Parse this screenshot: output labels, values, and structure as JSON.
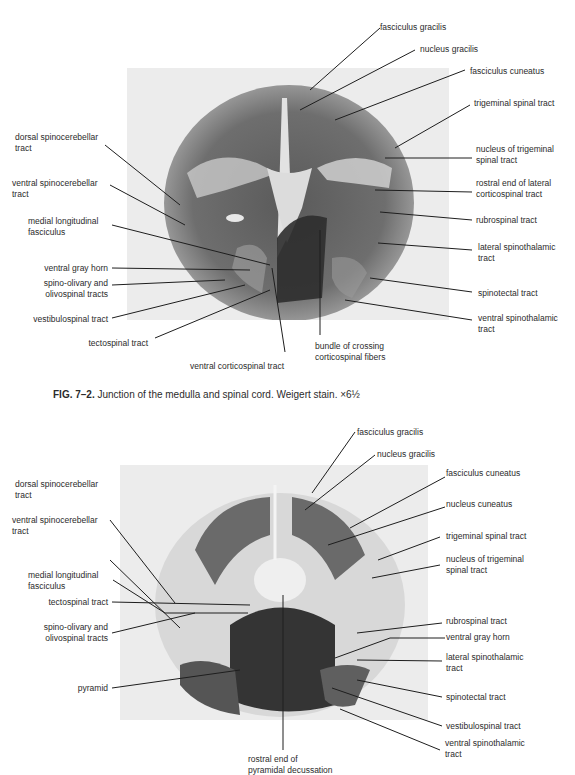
{
  "figure1": {
    "caption": {
      "number": "FIG. 7–2.",
      "text": "Junction of the medulla and spinal cord. Weigert stain. ×6½"
    },
    "labels": {
      "fasciculus_gracilis": "fasciculus gracilis",
      "nucleus_gracilis": "nucleus gracilis",
      "fasciculus_cuneatus": "fasciculus cuneatus",
      "trigeminal_spinal_tract": "trigeminal spinal tract",
      "nucleus_trigeminal": "nucleus of trigeminal\nspinal tract",
      "rostral_lateral_cst": "rostral end of lateral\ncorticospinal tract",
      "rubrospinal": "rubrospinal tract",
      "lateral_spinothalamic": "lateral spinothalamic\ntract",
      "spinotectal": "spinotectal tract",
      "ventral_spinothalamic": "ventral spinothalamic\ntract",
      "bundle_crossing": "bundle of crossing\ncorticospinal fibers",
      "ventral_cst": "ventral corticospinal tract",
      "tectospinal": "tectospinal tract",
      "vestibulospinal": "vestibulospinal tract",
      "spino_olivary": "spino-olivary and\nolivospinal tracts",
      "ventral_gray_horn": "ventral gray horn",
      "mlf": "medial longitudinal\nfasciculus",
      "ventral_spinocerebellar": "ventral spinocerebellar\ntract",
      "dorsal_spinocerebellar": "dorsal spinocerebellar\ntract"
    }
  },
  "figure2": {
    "labels": {
      "fasciculus_gracilis": "fasciculus gracilis",
      "nucleus_gracilis": "nucleus gracilis",
      "fasciculus_cuneatus": "fasciculus cuneatus",
      "nucleus_cuneatus": "nucleus cuneatus",
      "trigeminal_spinal_tract": "trigeminal spinal tract",
      "nucleus_trigeminal": "nucleus of trigeminal\nspinal tract",
      "rubrospinal": "rubrospinal tract",
      "ventral_gray_horn": "ventral gray horn",
      "lateral_spinothalamic": "lateral spinothalamic\ntract",
      "spinotectal": "spinotectal tract",
      "vestibulospinal": "vestibulospinal tract",
      "ventral_spinothalamic": "ventral spinothalamic\ntract",
      "rostral_pyramidal": "rostral end of\npyramidal decussation",
      "pyramid": "pyramid",
      "spino_olivary": "spino-olivary and\nolivospinal tracts",
      "tectospinal": "tectospinal tract",
      "mlf": "medial longitudinal\nfasciculus",
      "ventral_spinocerebellar": "ventral spinocerebellar\ntract",
      "dorsal_spinocerebellar": "dorsal spinocerebellar\ntract"
    }
  },
  "colors": {
    "photo_background": "#ececec",
    "tissue_dark": "#3a3a3a",
    "tissue_mid": "#7a7a7a",
    "tissue_light": "#d6d6d6",
    "text": "#2b2b2b"
  }
}
